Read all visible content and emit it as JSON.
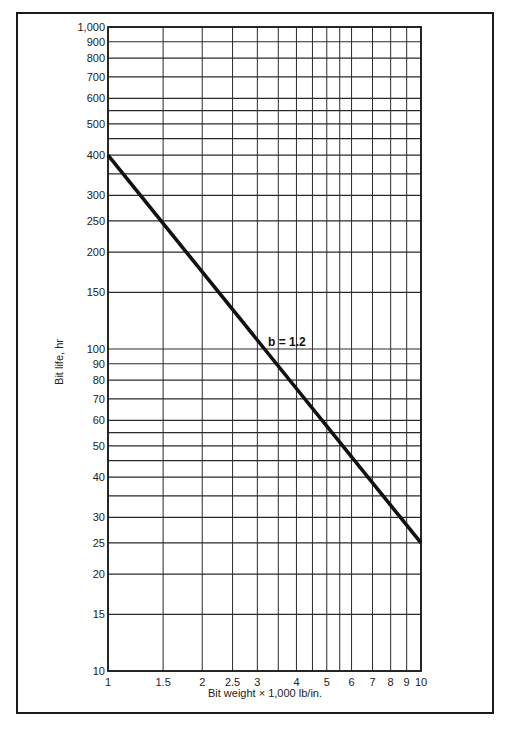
{
  "chart_data": {
    "type": "line",
    "title": "",
    "xlabel": "Bit weight  ×  1,000 lb/in.",
    "ylabel": "Bit life, hr",
    "xscale": "log",
    "yscale": "log",
    "xlim": [
      1,
      10
    ],
    "ylim": [
      10,
      1000
    ],
    "grid": true,
    "x_ticks": [
      1,
      1.5,
      2,
      2.5,
      3,
      4,
      5,
      6,
      7,
      8,
      9,
      10
    ],
    "x_tick_labels": [
      "1",
      "1.5",
      "2",
      "2.5",
      "3",
      "4",
      "5",
      "6",
      "7",
      "8",
      "9",
      "10"
    ],
    "x_gridlines": [
      1,
      1.5,
      2,
      2.5,
      3,
      3.5,
      4,
      4.5,
      5,
      5.5,
      6,
      7,
      8,
      9,
      10
    ],
    "y_ticks": [
      10,
      15,
      20,
      25,
      30,
      40,
      50,
      60,
      70,
      80,
      90,
      100,
      150,
      200,
      250,
      300,
      400,
      500,
      600,
      700,
      800,
      900,
      1000
    ],
    "y_tick_labels": [
      "10",
      "15",
      "20",
      "25",
      "30",
      "40",
      "50",
      "60",
      "70",
      "80",
      "90",
      "100",
      "150",
      "200",
      "250",
      "300",
      "400",
      "500",
      "600",
      "700",
      "800",
      "900",
      "1,000"
    ],
    "y_gridlines": [
      10,
      15,
      20,
      25,
      30,
      35,
      40,
      45,
      50,
      55,
      60,
      70,
      80,
      90,
      100,
      150,
      200,
      250,
      300,
      350,
      400,
      450,
      500,
      550,
      600,
      700,
      800,
      900,
      1000
    ],
    "series": [
      {
        "name": "b = 1.2",
        "x": [
          1,
          10
        ],
        "y": [
          400,
          25
        ]
      }
    ],
    "annotations": [
      {
        "text": "b  =  1.2",
        "x": 3.1,
        "y": 105
      }
    ],
    "legend": null
  }
}
